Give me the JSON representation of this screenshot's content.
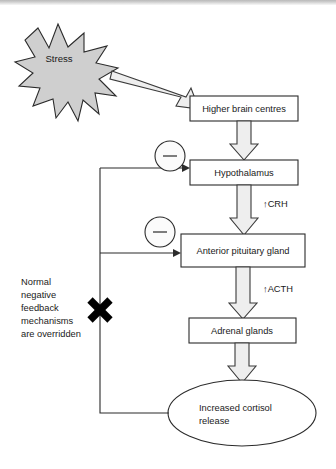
{
  "diagram": {
    "type": "flowchart",
    "stressor": {
      "label": "Stress",
      "shape": "starburst",
      "fill": "#cfcfcf"
    },
    "nodes": [
      {
        "id": "higher-brain-centres",
        "label": "Higher brain centres",
        "shape": "rect"
      },
      {
        "id": "hypothalamus",
        "label": "Hypothalamus",
        "shape": "rect"
      },
      {
        "id": "anterior-pituitary-gland",
        "label": "Anterior pituitary gland",
        "shape": "rect"
      },
      {
        "id": "adrenal-glands",
        "label": "Adrenal glands",
        "shape": "rect"
      },
      {
        "id": "increased-cortisol-release",
        "label": "Increased cortisol release",
        "label_line1": "Increased cortisol",
        "label_line2": "release",
        "shape": "ellipse"
      }
    ],
    "hormone_labels": [
      {
        "id": "crh",
        "label": "↑CRH"
      },
      {
        "id": "acth",
        "label": "↑ACTH"
      }
    ],
    "feedback": {
      "signs": [
        "−",
        "−"
      ],
      "sign_label": "minus",
      "blocked_marker": "✕",
      "note_lines": [
        "Normal",
        "negative",
        "feedback",
        "mechanisms",
        "are overridden"
      ],
      "note_text": "Normal negative feedback mechanisms are overridden"
    },
    "colors": {
      "background": "#ffffff",
      "stroke": "#2b2b2b",
      "arrow_fill": "#eeeeee",
      "burst_fill": "#cfcfcf",
      "text": "#1a1a1a"
    }
  }
}
